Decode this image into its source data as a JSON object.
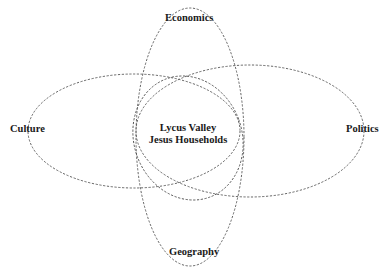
{
  "diagram": {
    "type": "venn",
    "center": {
      "line1": "Lycus Valley",
      "line2": "Jesus Households"
    },
    "domains": [
      {
        "id": "economics",
        "label": "Economics"
      },
      {
        "id": "geography",
        "label": "Geography"
      },
      {
        "id": "culture",
        "label": "Culture"
      },
      {
        "id": "politics",
        "label": "Politics"
      }
    ],
    "stroke_color": "#555555",
    "text_color": "#1a1a1a",
    "background": "#ffffff"
  }
}
